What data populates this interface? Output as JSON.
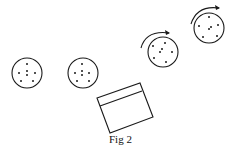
{
  "figure": {
    "caption": "Fig 2",
    "stroke_color": "#1a1a1a",
    "background": "#ffffff"
  },
  "discs": [
    {
      "id": "disc-1",
      "cx": 27,
      "cy": 73,
      "r": 15,
      "rotating": false,
      "dots": [
        [
          27,
          64
        ],
        [
          27,
          71
        ],
        [
          27,
          75
        ],
        [
          19,
          73
        ],
        [
          35,
          73
        ],
        [
          21,
          81
        ],
        [
          33,
          81
        ]
      ]
    },
    {
      "id": "disc-2",
      "cx": 83,
      "cy": 73,
      "r": 15,
      "rotating": false,
      "dots": [
        [
          82,
          64
        ],
        [
          82,
          71
        ],
        [
          82,
          75
        ],
        [
          75,
          73
        ],
        [
          89,
          73
        ],
        [
          77,
          81
        ],
        [
          89,
          81
        ]
      ]
    },
    {
      "id": "disc-3",
      "cx": 163,
      "cy": 52,
      "r": 15,
      "rotating": true,
      "dots": [
        [
          153,
          46
        ],
        [
          165,
          43
        ],
        [
          162,
          49
        ],
        [
          160,
          52
        ],
        [
          172,
          52
        ],
        [
          154,
          58
        ],
        [
          166,
          62
        ]
      ]
    },
    {
      "id": "disc-4",
      "cx": 209,
      "cy": 28,
      "r": 15,
      "rotating": true,
      "dots": [
        [
          209,
          17
        ],
        [
          199,
          26
        ],
        [
          211,
          27
        ],
        [
          209,
          29
        ],
        [
          218,
          25
        ],
        [
          203,
          37
        ],
        [
          217,
          36
        ]
      ]
    }
  ],
  "arrows": [
    {
      "id": "rotation-arrow-3",
      "path": "M141,48 Q146,30 169,33",
      "head": [
        170,
        33
      ]
    },
    {
      "id": "rotation-arrow-4",
      "path": "M191,24 Q197,5 219,8",
      "head": [
        220,
        8
      ]
    }
  ],
  "tray": {
    "outer": [
      [
        97,
        98
      ],
      [
        140,
        83
      ],
      [
        153,
        117
      ],
      [
        110,
        133
      ]
    ],
    "inner_line": [
      [
        100,
        106
      ],
      [
        142,
        91
      ]
    ]
  }
}
